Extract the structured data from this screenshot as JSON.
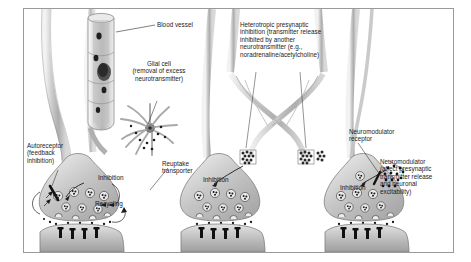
{
  "figure": {
    "background": "#ffffff",
    "border_color": "#9a9a9a"
  },
  "labels": {
    "blood_vessel": "Blood vessel",
    "glial_cell": "Glial cell\n(removal of excess\nneurotransmitter)",
    "heterotropic": "Heterotropic presynaptic\ninhibition (transmitter release\ninhibited by another\nneurotransmitter (e.g.,\nnoradrenaline/acetylcholine)",
    "autoreceptor": "Autoreceptor\n(feedback\ninhibition)",
    "reuptake": "Reuptake\ntransporter",
    "neuromodulator_receptor": "Neuromodulator\nreceptor",
    "neuromodulator": "Neuromodulator\n(affect presynaptic\ntransmitter release\nand neuronal\nexcitability)",
    "recycling": "Recycling",
    "inhibition_1": "Inhibition",
    "inhibition_2": "Inhibition",
    "inhibition_3": "Inhibition"
  },
  "colors": {
    "axon_fill": "#c9c9c9",
    "axon_edge": "#8d8d8d",
    "terminal_fill": "#bdbdbd",
    "postsynaptic_fill": "#c4c4c4",
    "vessel_fill": "#d4d4d4",
    "glial_fill": "#b4b4b4",
    "receptor_dark": "#1c1c1c",
    "text": "#1a1a1a"
  }
}
